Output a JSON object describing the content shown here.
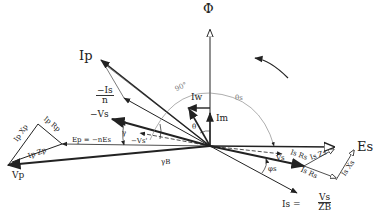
{
  "labels": {
    "phi": "Φ",
    "Ip": "Ip",
    "minus_Is_n_num": "−Is",
    "minus_Is_n_den": "n",
    "Iw": "Iw",
    "Im": "Im",
    "minus_Vs": "−Vs",
    "gamma": "γ",
    "Vs_prime": "−Vs'",
    "Ep": "Ep = −nEs",
    "gamma_B": "γB",
    "Vp": "Vp",
    "Ip_Xp": "Ip Xp",
    "Ip_Rp": "Ip Rp",
    "Ip_Zp": "Ip Zp",
    "Es": "Es",
    "Vs_label": "Vs",
    "Is_Rs_upper": "Is Rs",
    "Is_Zs": "Is Zs",
    "Is_Rs_lower": "Is Rs",
    "Is_Xs": "Is Xs",
    "phi_s": "φs",
    "Is_eq": "Is =",
    "Is_eq_num": "Vs",
    "Is_eq_den": "ZB",
    "angle_90": "90°",
    "angle_theta_s": "θs",
    "angle_theta": "θ"
  },
  "phasors": [
    {
      "name": "Phi",
      "desc": "flux, vertical reference"
    },
    {
      "name": "Ip",
      "desc": "primary current"
    },
    {
      "name": "-Is/n",
      "desc": "reflected secondary current"
    },
    {
      "name": "Iw",
      "desc": "core-loss current component"
    },
    {
      "name": "Im",
      "desc": "magnetizing current"
    },
    {
      "name": "-Vs",
      "desc": "negative secondary voltage"
    },
    {
      "name": "Ep",
      "desc": "primary EMF = -n Es"
    },
    {
      "name": "Vp",
      "desc": "primary terminal voltage"
    },
    {
      "name": "Es",
      "desc": "secondary EMF"
    },
    {
      "name": "Vs",
      "desc": "secondary terminal voltage"
    },
    {
      "name": "Is",
      "desc": "secondary current = Vs/ZB"
    }
  ]
}
